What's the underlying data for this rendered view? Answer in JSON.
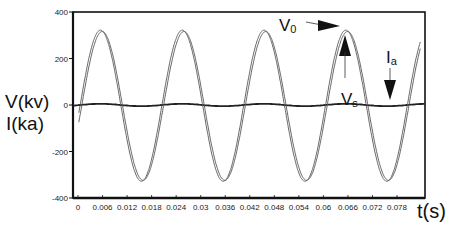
{
  "chart_data": {
    "type": "line",
    "title": "",
    "xlabel": "t(s)",
    "ylabel": [
      "V(kv)",
      "I(ka)"
    ],
    "xlim": [
      0,
      0.0848
    ],
    "ylim": [
      -400,
      400
    ],
    "grid": false,
    "legend": "none (inline annotations)",
    "x_ticks": [
      "0",
      "0.006",
      "0.012",
      "0.018",
      "0.024",
      "0.03",
      "0.036",
      "0.042",
      "0.048",
      "0.054",
      "0.06",
      "0.066",
      "0.072",
      "0.078"
    ],
    "x_tick_values": [
      0,
      0.006,
      0.012,
      0.018,
      0.024,
      0.03,
      0.036,
      0.042,
      0.048,
      0.054,
      0.06,
      0.066,
      0.072,
      0.078
    ],
    "y_ticks": [
      "400",
      "200",
      "0",
      "-200",
      "-400"
    ],
    "y_tick_values": [
      400,
      200,
      0,
      -200,
      -400
    ],
    "series": [
      {
        "name": "V0",
        "description": "voltage, sinusoid ~50 Hz",
        "amplitude": 325,
        "frequency_hz": 50,
        "peak_times": [
          0.0055,
          0.0255,
          0.0455,
          0.0655
        ],
        "trough_times": [
          0.0155,
          0.0355,
          0.0555,
          0.0755
        ],
        "peak_value": 325,
        "trough_value": -330
      },
      {
        "name": "Vs",
        "description": "voltage, nearly overlapping V0, slight lag",
        "amplitude": 320,
        "frequency_hz": 50,
        "peak_value": 320,
        "trough_value": -325
      },
      {
        "name": "Ia",
        "description": "current, near zero with small ripple",
        "approx_value": 0,
        "ripple": 5
      }
    ],
    "annotations": [
      {
        "text": "V0",
        "points_to": "V0 peak near t=0.066",
        "arrow": "right"
      },
      {
        "text": "Vs",
        "points_to": "Vs peak near t=0.066",
        "arrow": "up"
      },
      {
        "text": "Ia",
        "points_to": "Ia trace near zero",
        "arrow": "down"
      }
    ]
  },
  "labels": {
    "y_axis_line1": "V(kv)",
    "y_axis_line2": "I(ka)",
    "x_axis": "t(s)",
    "v0_main": "V",
    "v0_sub": "0",
    "vs_main": "V",
    "vs_sub": "s",
    "ia_main": "I",
    "ia_sub": "a"
  },
  "colors": {
    "axis": "#111111",
    "curve": "#555555",
    "current": "#222222",
    "background": "#ffffff"
  }
}
